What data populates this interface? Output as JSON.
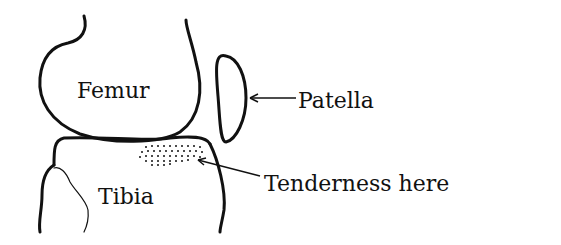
{
  "diagram": {
    "labels": {
      "femur": "Femur",
      "tibia": "Tibia",
      "patella": "Patella",
      "tenderness": "Tenderness here"
    },
    "colors": {
      "ink": "#111111",
      "background": "#ffffff"
    }
  }
}
